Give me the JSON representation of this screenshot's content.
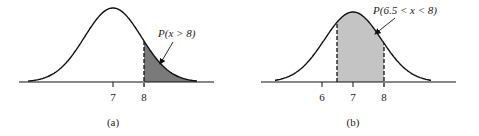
{
  "chart_data": [
    {
      "type": "area",
      "panel_label": "(a)",
      "annotation": "P(x > 8)",
      "distribution": "normal",
      "mean": 7,
      "shaded_region": {
        "from": 8,
        "to": "inf"
      },
      "tick_labels": [
        "7",
        "8"
      ],
      "ticks": [
        7,
        8
      ],
      "shade_color": "#7a7a7a",
      "xlabel": "",
      "ylabel": "",
      "grid": false
    },
    {
      "type": "area",
      "panel_label": "(b)",
      "annotation": "P(6.5 < x < 8)",
      "distribution": "normal",
      "mean": 7,
      "shaded_region": {
        "from": 6.5,
        "to": 8
      },
      "tick_labels": [
        "6",
        "7",
        "8"
      ],
      "ticks": [
        6,
        7,
        8
      ],
      "shade_color": "#c4c4c4",
      "xlabel": "",
      "ylabel": "",
      "grid": false
    }
  ]
}
